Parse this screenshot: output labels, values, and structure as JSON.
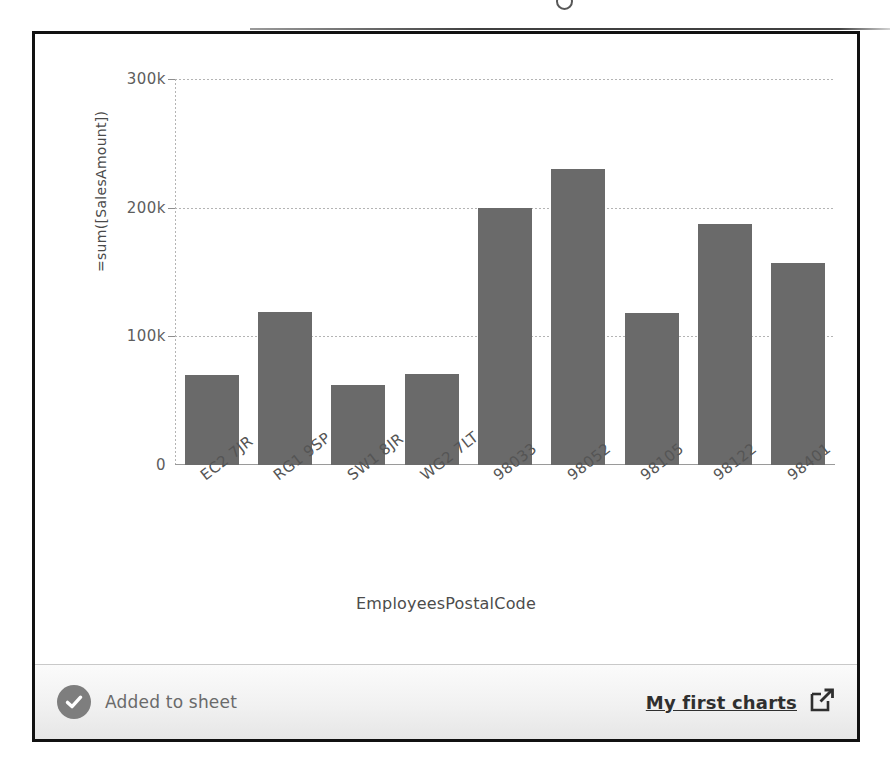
{
  "panel": {
    "border_color": "#111111",
    "background": "#ffffff"
  },
  "chart_data": {
    "type": "bar",
    "title": "",
    "xlabel": "EmployeesPostalCode",
    "ylabel": "=sum([SalesAmount])",
    "categories": [
      "EC2 7JR",
      "RG1 9SP",
      "SW1 8JR",
      "WG2 7LT",
      "98033",
      "98052",
      "98105",
      "98122",
      "98401"
    ],
    "values": [
      70000,
      119000,
      62000,
      71000,
      200000,
      230000,
      118000,
      187000,
      157000
    ],
    "ylim": [
      0,
      300000
    ],
    "yticks": [
      0,
      100000,
      200000,
      300000
    ],
    "ytick_labels": [
      "0",
      "100k",
      "200k",
      "300k"
    ],
    "grid": true,
    "legend": "none",
    "bar_color": "#6a6a6a",
    "gridline_color": "#b4b4b4",
    "xtick_rotation": -38
  },
  "statusbar": {
    "status_text": "Added to sheet",
    "status_icon": "check-circle-icon",
    "link_label": "My first charts",
    "link_icon": "external-link-icon",
    "badge_color": "#7e7e7e"
  }
}
